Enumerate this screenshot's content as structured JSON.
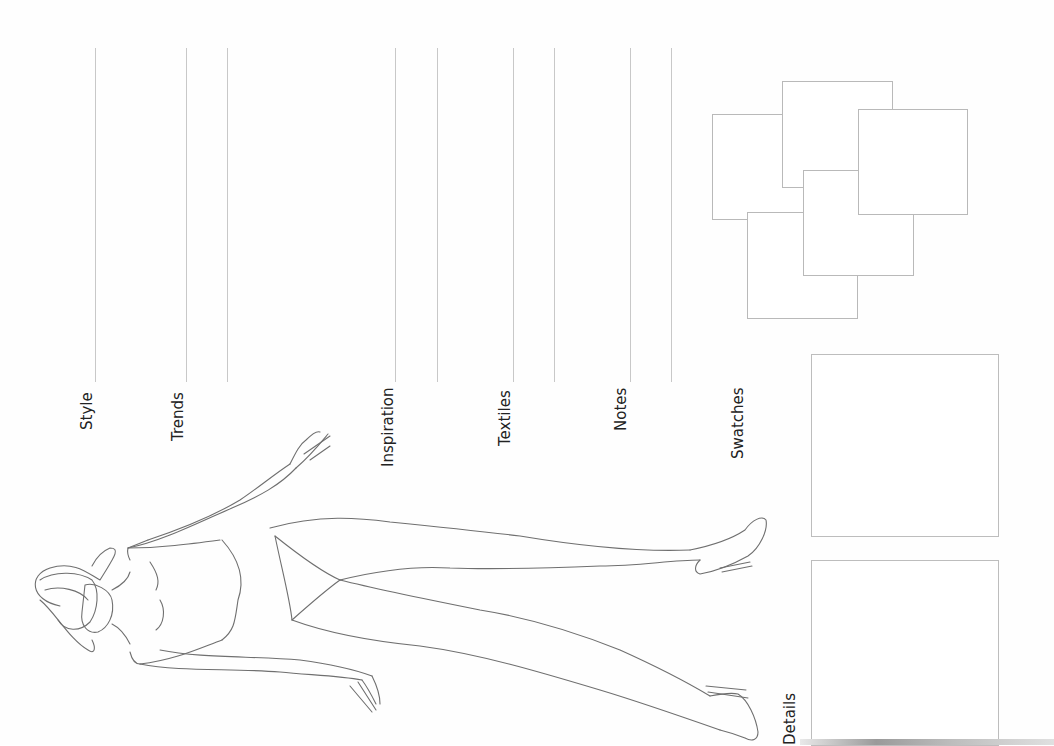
{
  "page": {
    "type": "fashion croquis template",
    "orientation": "rotated 90deg counter-clockwise",
    "colors": {
      "background": "#fefefe",
      "line": "#c8c8c8",
      "text": "#222222",
      "figure_stroke": "#6f6f6f"
    }
  },
  "sections": [
    {
      "id": "style",
      "label": "Style"
    },
    {
      "id": "trends",
      "label": "Trends"
    },
    {
      "id": "inspiration",
      "label": "Inspiration"
    },
    {
      "id": "textiles",
      "label": "Textiles"
    },
    {
      "id": "notes",
      "label": "Notes"
    },
    {
      "id": "swatches",
      "label": "Swatches"
    },
    {
      "id": "details",
      "label": "Details"
    }
  ],
  "swatch_squares_count": 5,
  "detail_boxes_count": 2
}
